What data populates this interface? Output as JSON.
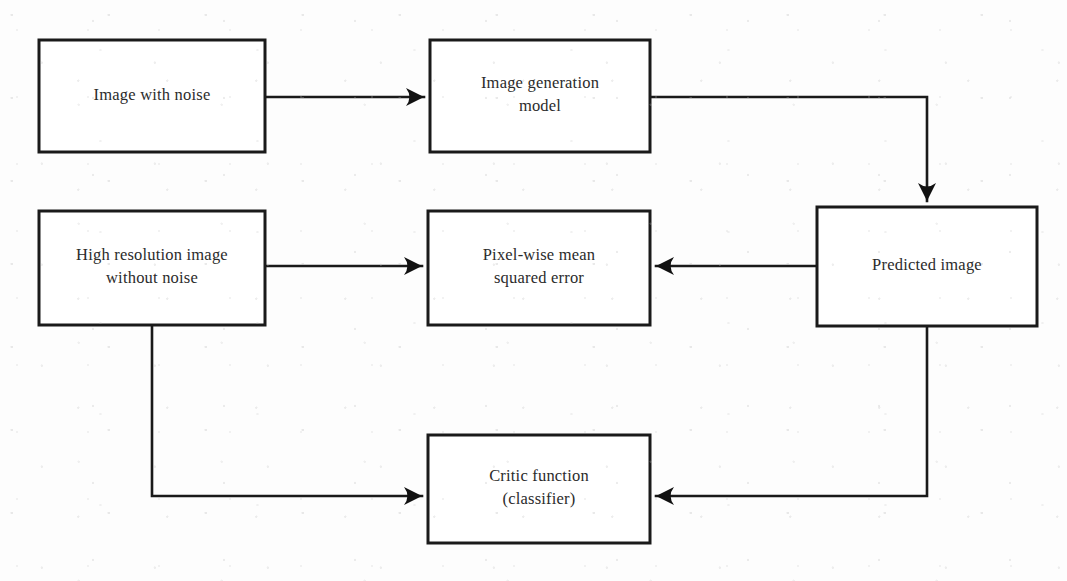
{
  "diagram": {
    "background_color": "#fdfdfd",
    "line_color": "#1a1a1a",
    "text_color": "#2b2b2b",
    "nodes": [
      {
        "id": "image-with-noise",
        "lines": [
          "Image with noise"
        ],
        "x": 39,
        "y": 40,
        "w": 226,
        "h": 112
      },
      {
        "id": "image-generation-model",
        "lines": [
          "Image generation",
          "model"
        ],
        "x": 430,
        "y": 40,
        "w": 220,
        "h": 112
      },
      {
        "id": "high-resolution-image-without-noise",
        "lines": [
          "High resolution image",
          "without noise"
        ],
        "x": 39,
        "y": 211,
        "w": 226,
        "h": 114
      },
      {
        "id": "pixel-wise-mean-squared-error",
        "lines": [
          "Pixel-wise mean",
          "squared  error"
        ],
        "x": 428,
        "y": 211,
        "w": 222,
        "h": 114
      },
      {
        "id": "predicted-image",
        "lines": [
          "Predicted  image"
        ],
        "x": 817,
        "y": 207,
        "w": 220,
        "h": 119
      },
      {
        "id": "critic-function-classifier",
        "lines": [
          "Critic function",
          "(classifier)"
        ],
        "x": 428,
        "y": 435,
        "w": 222,
        "h": 108
      }
    ],
    "edges": [
      {
        "id": "noise-to-generator",
        "from": "image-with-noise",
        "to": "image-generation-model",
        "points": "265,97 424,97",
        "arrow": {
          "dir": "right",
          "x": 424,
          "y": 97
        }
      },
      {
        "id": "generator-to-predicted",
        "from": "image-generation-model",
        "to": "predicted-image",
        "points": "650,97 927,97 927,201",
        "arrow": {
          "dir": "down",
          "x": 927,
          "y": 201
        }
      },
      {
        "id": "highres-to-mse",
        "from": "high-resolution-image-without-noise",
        "to": "pixel-wise-mean-squared-error",
        "points": "265,266 422,266",
        "arrow": {
          "dir": "right",
          "x": 422,
          "y": 266
        }
      },
      {
        "id": "predicted-to-mse",
        "from": "predicted-image",
        "to": "pixel-wise-mean-squared-error",
        "points": "817,266 656,266",
        "arrow": {
          "dir": "left",
          "x": 656,
          "y": 266
        }
      },
      {
        "id": "highres-to-critic",
        "from": "high-resolution-image-without-noise",
        "to": "critic-function-classifier",
        "points": "152,325 152,496 422,496",
        "arrow": {
          "dir": "right",
          "x": 422,
          "y": 496
        }
      },
      {
        "id": "predicted-to-critic",
        "from": "predicted-image",
        "to": "critic-function-classifier",
        "points": "927,326 927,496 656,496",
        "arrow": {
          "dir": "left",
          "x": 656,
          "y": 496
        }
      }
    ]
  }
}
